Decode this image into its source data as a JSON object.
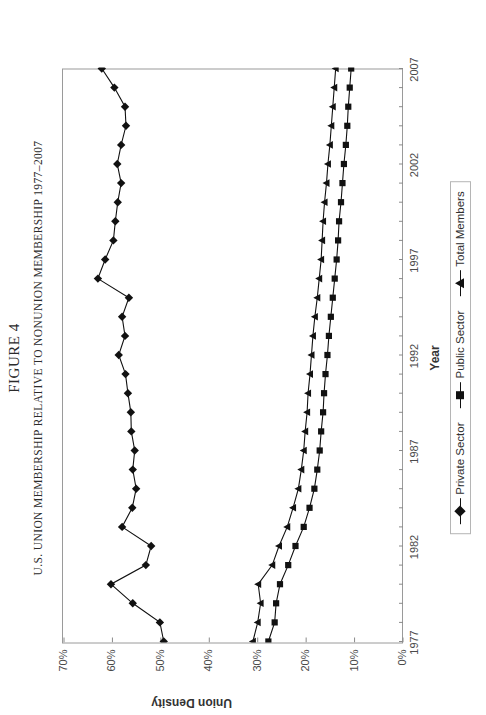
{
  "figure": {
    "number_label": "FIGURE 4",
    "title": "U.S. UNION MEMBERSHIP RELATIVE TO NONUNION MEMBERSHIP 1977–2007",
    "title_plain": "U.S. Union Membership Relative to Nonunion Membership 1977–2007"
  },
  "chart_data": {
    "type": "line",
    "title": "U.S. Union Membership Relative to Nonunion Membership 1977–2007",
    "xlabel": "Year",
    "ylabel": "Union Density",
    "xlim": [
      1977,
      2007
    ],
    "ylim": [
      0,
      70
    ],
    "ytick_labels": [
      "0%",
      "10%",
      "20%",
      "30%",
      "40%",
      "50%",
      "60%",
      "70%"
    ],
    "ytick_values": [
      0,
      10,
      20,
      30,
      40,
      50,
      60,
      70
    ],
    "xtick_labels": [
      "1977",
      "1982",
      "1987",
      "1992",
      "1997",
      "2002",
      "2007"
    ],
    "xtick_values": [
      1977,
      1982,
      1987,
      1992,
      1997,
      2002,
      2007
    ],
    "grid": false,
    "legend_position": "bottom",
    "x": [
      1977,
      1978,
      1979,
      1980,
      1981,
      1982,
      1983,
      1984,
      1985,
      1986,
      1987,
      1988,
      1989,
      1990,
      1991,
      1992,
      1993,
      1994,
      1995,
      1996,
      1997,
      1998,
      1999,
      2000,
      2001,
      2002,
      2003,
      2004,
      2005,
      2006,
      2007
    ],
    "series": [
      {
        "name": "Private Sector",
        "marker": "diamond",
        "color": "#111111",
        "values": [
          49.4,
          50.2,
          55.8,
          60.3,
          53.1,
          52.0,
          58.0,
          55.9,
          55.1,
          55.8,
          55.4,
          56.1,
          56.2,
          56.8,
          57.3,
          58.7,
          57.4,
          58.0,
          56.6,
          63.0,
          61.5,
          59.8,
          59.4,
          58.9,
          58.2,
          59.0,
          58.2,
          57.2,
          57.4,
          59.6,
          62.2
        ]
      },
      {
        "name": "Public Sector",
        "marker": "square",
        "color": "#111111",
        "values": [
          27.8,
          26.5,
          26.2,
          25.4,
          23.7,
          22.2,
          20.5,
          19.3,
          18.3,
          17.7,
          17.2,
          16.9,
          16.5,
          16.3,
          16.0,
          15.6,
          15.3,
          14.9,
          14.5,
          14.1,
          13.7,
          13.4,
          13.2,
          12.8,
          12.5,
          12.2,
          11.8,
          11.5,
          11.3,
          11.0,
          10.7
        ]
      },
      {
        "name": "Total Members",
        "marker": "triangle",
        "color": "#111111",
        "values": [
          31.0,
          30.0,
          29.4,
          29.9,
          27.0,
          25.6,
          23.9,
          22.7,
          21.6,
          21.0,
          20.5,
          20.2,
          19.8,
          19.6,
          19.2,
          18.9,
          18.6,
          18.2,
          17.7,
          17.3,
          16.9,
          16.7,
          16.5,
          16.2,
          15.8,
          15.5,
          15.1,
          14.8,
          14.5,
          14.2,
          13.9
        ]
      }
    ]
  },
  "legend": {
    "items": [
      {
        "label": "Private Sector",
        "marker": "diamond"
      },
      {
        "label": "Public Sector",
        "marker": "square"
      },
      {
        "label": "Total Members",
        "marker": "triangle"
      }
    ]
  }
}
